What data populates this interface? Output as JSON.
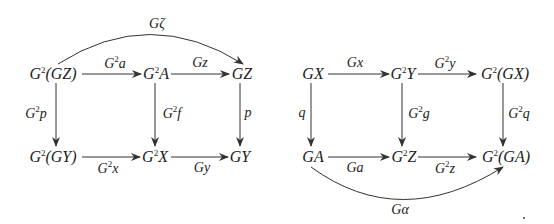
{
  "diagram_left": {
    "objects": [
      {
        "id": "G2GZ",
        "pre": "G",
        "sup": "2",
        "post": "(GZ)",
        "x": 53,
        "y": 74
      },
      {
        "id": "G2A",
        "pre": "G",
        "sup": "2",
        "post": "A",
        "x": 156,
        "y": 74
      },
      {
        "id": "GZ",
        "pre": "",
        "sup": "",
        "post": "GZ",
        "x": 242,
        "y": 74
      },
      {
        "id": "G2GY",
        "pre": "G",
        "sup": "2",
        "post": "(GY)",
        "x": 53,
        "y": 157
      },
      {
        "id": "G2X",
        "pre": "G",
        "sup": "2",
        "post": "X",
        "x": 155,
        "y": 157
      },
      {
        "id": "GY",
        "pre": "",
        "sup": "",
        "post": "GY",
        "x": 240,
        "y": 157
      }
    ],
    "arrows": [
      {
        "from": "G2GZ",
        "to": "G2A",
        "pre": "G",
        "sup": "2",
        "post": "a",
        "lx": 115,
        "ly": 63
      },
      {
        "from": "G2A",
        "to": "GZ",
        "pre": "",
        "sup": "",
        "post": "Gz",
        "lx": 200,
        "ly": 63
      },
      {
        "from": "G2GZ",
        "to": "G2GY",
        "pre": "G",
        "sup": "2",
        "post": "p",
        "lx": 36,
        "ly": 113
      },
      {
        "from": "G2A",
        "to": "G2X",
        "pre": "G",
        "sup": "2",
        "post": "f",
        "lx": 171,
        "ly": 113
      },
      {
        "from": "GZ",
        "to": "GY",
        "pre": "",
        "sup": "",
        "post": "p",
        "lx": 248,
        "ly": 113
      },
      {
        "from": "G2GY",
        "to": "G2X",
        "pre": "G",
        "sup": "2",
        "post": "x",
        "lx": 108,
        "ly": 168
      },
      {
        "from": "G2X",
        "to": "GY",
        "pre": "",
        "sup": "",
        "post": "Gy",
        "lx": 202,
        "ly": 168
      },
      {
        "from": "G2GZ",
        "to": "GZ",
        "curved": true,
        "pre": "",
        "sup": "",
        "post": "Gζ",
        "lx": 157,
        "ly": 24
      }
    ]
  },
  "diagram_right": {
    "objects": [
      {
        "id": "GX",
        "pre": "",
        "sup": "",
        "post": "GX",
        "x": 313,
        "y": 74
      },
      {
        "id": "G2Y",
        "pre": "G",
        "sup": "2",
        "post": "Y",
        "x": 403,
        "y": 74
      },
      {
        "id": "G2GX",
        "pre": "G",
        "sup": "2",
        "post": "(GX)",
        "x": 505,
        "y": 74
      },
      {
        "id": "GA",
        "pre": "",
        "sup": "",
        "post": "GA",
        "x": 313,
        "y": 157
      },
      {
        "id": "G2Z",
        "pre": "G",
        "sup": "2",
        "post": "Z",
        "x": 404,
        "y": 157
      },
      {
        "id": "G2GA",
        "pre": "G",
        "sup": "2",
        "post": "(GA)",
        "x": 506,
        "y": 157
      }
    ],
    "arrows": [
      {
        "from": "GX",
        "to": "G2Y",
        "pre": "",
        "sup": "",
        "post": "Gx",
        "lx": 355,
        "ly": 63
      },
      {
        "from": "G2Y",
        "to": "G2GX",
        "pre": "G",
        "sup": "2",
        "post": "y",
        "lx": 445,
        "ly": 63
      },
      {
        "from": "GX",
        "to": "GA",
        "pre": "",
        "sup": "",
        "post": "q",
        "lx": 303,
        "ly": 113
      },
      {
        "from": "G2Y",
        "to": "G2Z",
        "pre": "G",
        "sup": "2",
        "post": "g",
        "lx": 418,
        "ly": 113
      },
      {
        "from": "G2GX",
        "to": "G2GA",
        "pre": "G",
        "sup": "2",
        "post": "q",
        "lx": 518,
        "ly": 113
      },
      {
        "from": "GA",
        "to": "G2Z",
        "pre": "",
        "sup": "",
        "post": "Ga",
        "lx": 355,
        "ly": 168
      },
      {
        "from": "G2Z",
        "to": "G2GA",
        "pre": "G",
        "sup": "2",
        "post": "z",
        "lx": 445,
        "ly": 168
      },
      {
        "from": "GA",
        "to": "G2GA",
        "curved": true,
        "pre": "",
        "sup": "",
        "post": "Gα",
        "lx": 400,
        "ly": 210
      }
    ]
  },
  "stroke_color": "#333333",
  "text_color": "#222222"
}
